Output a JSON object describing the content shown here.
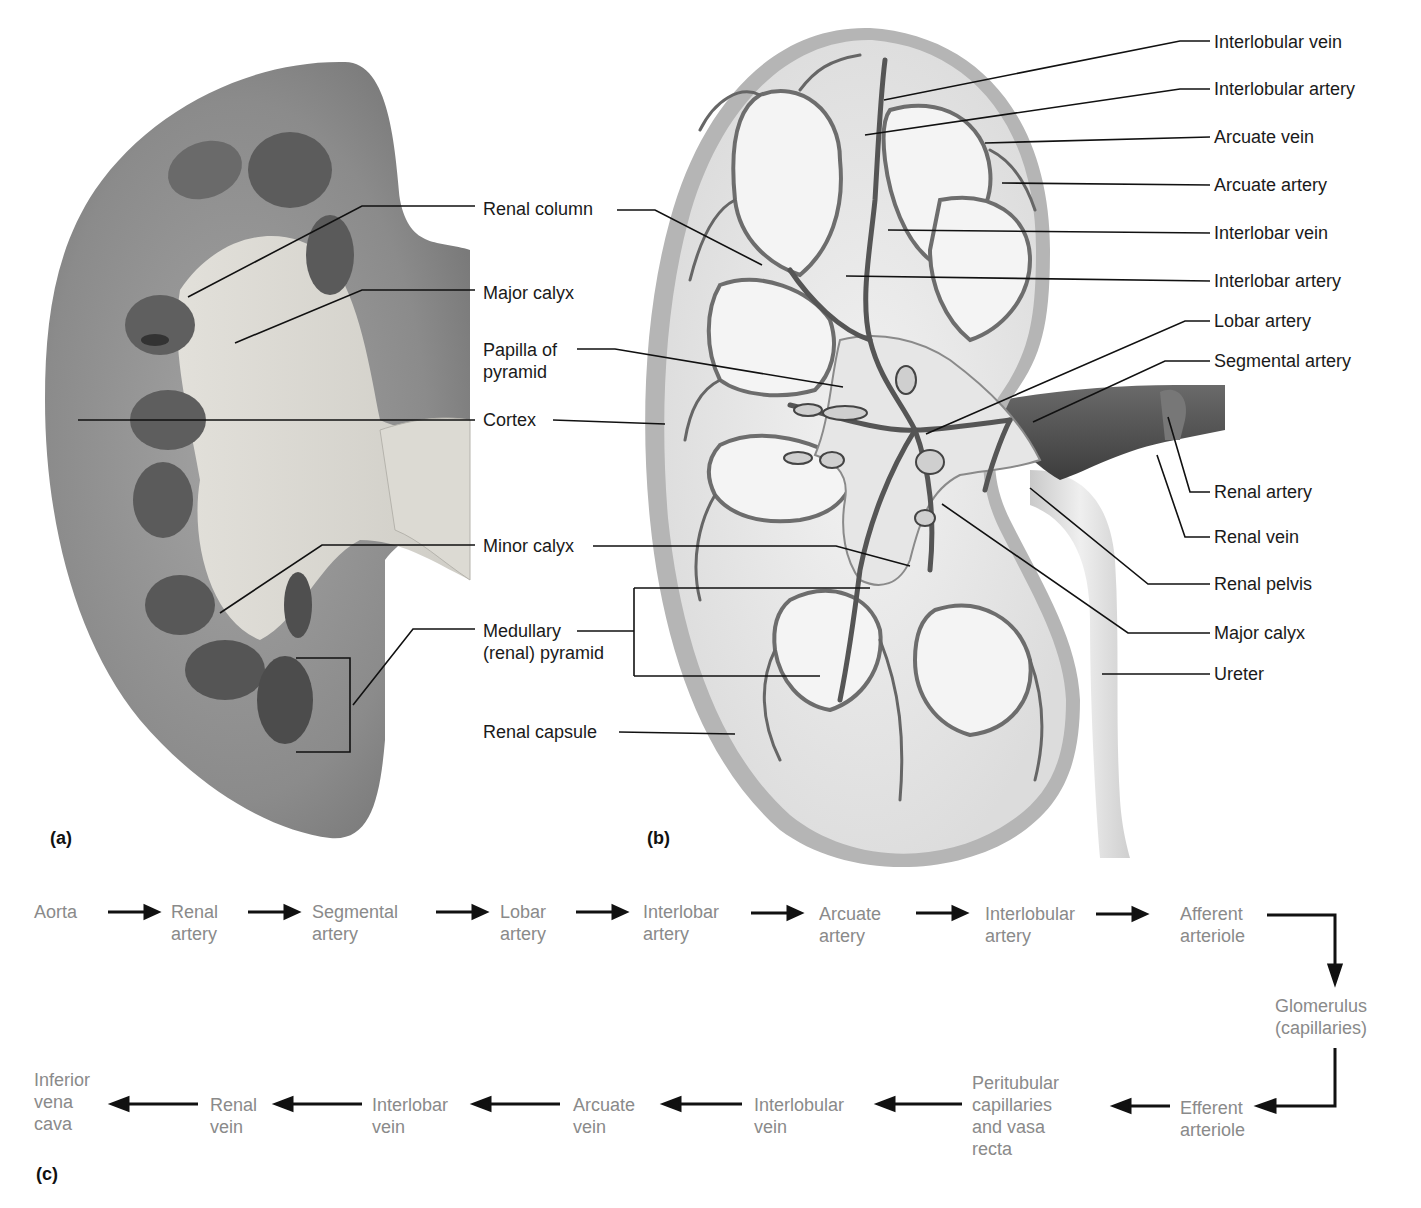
{
  "figure": {
    "panels": {
      "a": "(a)",
      "b": "(b)",
      "c": "(c)"
    },
    "center_labels": [
      {
        "id": "renal-column",
        "text": "Renal column",
        "x": 483,
        "y": 198
      },
      {
        "id": "major-calyx-left",
        "text": "Major calyx",
        "x": 483,
        "y": 282
      },
      {
        "id": "papilla-of-pyramid",
        "text": "Papilla of\npyramid",
        "x": 483,
        "y": 339
      },
      {
        "id": "cortex",
        "text": "Cortex",
        "x": 483,
        "y": 409
      },
      {
        "id": "minor-calyx",
        "text": "Minor calyx",
        "x": 483,
        "y": 535
      },
      {
        "id": "medullary-pyramid",
        "text": "Medullary\n(renal) pyramid",
        "x": 483,
        "y": 620
      },
      {
        "id": "renal-capsule",
        "text": "Renal capsule",
        "x": 483,
        "y": 721
      }
    ],
    "right_labels": [
      {
        "id": "interlobular-vein",
        "text": "Interlobular vein",
        "x": 1214,
        "y": 31
      },
      {
        "id": "interlobular-artery",
        "text": "Interlobular artery",
        "x": 1214,
        "y": 78
      },
      {
        "id": "arcuate-vein",
        "text": "Arcuate vein",
        "x": 1214,
        "y": 126
      },
      {
        "id": "arcuate-artery",
        "text": "Arcuate artery",
        "x": 1214,
        "y": 174
      },
      {
        "id": "interlobar-vein",
        "text": "Interlobar vein",
        "x": 1214,
        "y": 222
      },
      {
        "id": "interlobar-artery",
        "text": "Interlobar artery",
        "x": 1214,
        "y": 270
      },
      {
        "id": "lobar-artery",
        "text": "Lobar artery",
        "x": 1214,
        "y": 310
      },
      {
        "id": "segmental-artery",
        "text": "Segmental artery",
        "x": 1214,
        "y": 350
      },
      {
        "id": "renal-artery",
        "text": "Renal artery",
        "x": 1214,
        "y": 481
      },
      {
        "id": "renal-vein",
        "text": "Renal vein",
        "x": 1214,
        "y": 526
      },
      {
        "id": "renal-pelvis",
        "text": "Renal pelvis",
        "x": 1214,
        "y": 573
      },
      {
        "id": "major-calyx-right",
        "text": "Major calyx",
        "x": 1214,
        "y": 622
      },
      {
        "id": "ureter",
        "text": "Ureter",
        "x": 1214,
        "y": 663
      }
    ],
    "flow_top": [
      {
        "id": "aorta",
        "text": "Aorta",
        "x": 34,
        "y": 901
      },
      {
        "id": "renal-artery",
        "text": "Renal\nartery",
        "x": 171,
        "y": 901
      },
      {
        "id": "segmental-artery",
        "text": "Segmental\nartery",
        "x": 312,
        "y": 901
      },
      {
        "id": "lobar-artery",
        "text": "Lobar\nartery",
        "x": 500,
        "y": 901
      },
      {
        "id": "interlobar-artery",
        "text": "Interlobar\nartery",
        "x": 643,
        "y": 901
      },
      {
        "id": "arcuate-artery",
        "text": "Arcuate\nartery",
        "x": 819,
        "y": 903
      },
      {
        "id": "interlobular-artery",
        "text": "Interlobular\nartery",
        "x": 985,
        "y": 903
      },
      {
        "id": "afferent-arteriole",
        "text": "Afferent\narteriole",
        "x": 1180,
        "y": 903
      }
    ],
    "flow_middle": [
      {
        "id": "glomerulus",
        "text": "Glomerulus\n(capillaries)",
        "x": 1275,
        "y": 995
      }
    ],
    "flow_bottom": [
      {
        "id": "efferent-arteriole",
        "text": "Efferent\narteriole",
        "x": 1180,
        "y": 1097
      },
      {
        "id": "peritubular-capillaries",
        "text": "Peritubular\ncapillaries\nand vasa\nrecta",
        "x": 972,
        "y": 1072
      },
      {
        "id": "interlobular-vein",
        "text": "Interlobular\nvein",
        "x": 754,
        "y": 1094
      },
      {
        "id": "arcuate-vein",
        "text": "Arcuate\nvein",
        "x": 573,
        "y": 1094
      },
      {
        "id": "interlobar-vein",
        "text": "Interlobar\nvein",
        "x": 372,
        "y": 1094
      },
      {
        "id": "renal-vein",
        "text": "Renal\nvein",
        "x": 210,
        "y": 1094
      },
      {
        "id": "inferior-vena-cava",
        "text": "Inferior\nvena\ncava",
        "x": 34,
        "y": 1069
      }
    ],
    "colors": {
      "flow_text": "#8a8a8a",
      "label_text": "#1a1a1a",
      "kidney_cortex": "#8e8e8e",
      "pyramid_dark": "#5a5a5a",
      "sinus_light": "#d8d6d0",
      "vessel_dark": "#4d4d4d"
    }
  }
}
